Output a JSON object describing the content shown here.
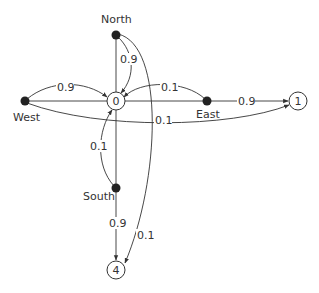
{
  "diagram": {
    "type": "state-transition-graph",
    "nodes": {
      "north": {
        "label": "North",
        "kind": "filled-dot"
      },
      "west": {
        "label": "West",
        "kind": "filled-dot"
      },
      "east": {
        "label": "East",
        "kind": "filled-dot"
      },
      "south": {
        "label": "South",
        "kind": "filled-dot"
      },
      "s0": {
        "label": "0",
        "kind": "circle"
      },
      "s1": {
        "label": "1",
        "kind": "circle"
      },
      "s4": {
        "label": "4",
        "kind": "circle"
      }
    },
    "edges": [
      {
        "from": "North",
        "to": "0",
        "label": "0.9"
      },
      {
        "from": "North",
        "to": "4",
        "label": "0.1"
      },
      {
        "from": "West",
        "to": "0",
        "label": "0.9"
      },
      {
        "from": "West",
        "to": "1",
        "label": "0.1"
      },
      {
        "from": "East",
        "to": "0",
        "label": "0.1"
      },
      {
        "from": "East",
        "to": "1",
        "label": "0.9"
      },
      {
        "from": "South",
        "to": "0",
        "label": "0.1"
      },
      {
        "from": "South",
        "to": "4",
        "label": "0.9"
      }
    ],
    "labels": {
      "north_0": "0.9",
      "north_4": "0.1",
      "west_0": "0.9",
      "west_1": "0.1",
      "east_0": "0.1",
      "east_1": "0.9",
      "south_0": "0.1",
      "south_4": "0.9"
    }
  }
}
